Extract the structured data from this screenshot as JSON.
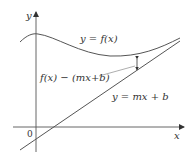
{
  "diagram": {
    "axes": {
      "x_label": "x",
      "y_label": "y",
      "origin_label": "0"
    },
    "curve": {
      "label": "y = f(x)",
      "color": "#555555"
    },
    "asymptote": {
      "label": "y = mx + b",
      "color": "#555555"
    },
    "difference": {
      "label": "f(x) − (mx+b)"
    }
  }
}
